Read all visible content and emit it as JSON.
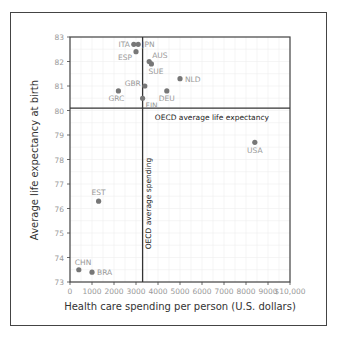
{
  "chart_data": {
    "type": "scatter",
    "title": "",
    "xlabel": "Health care spending per person (U.S. dollars)",
    "ylabel": "Average life expectancy at birth",
    "xlim": [
      0,
      10000
    ],
    "ylim": [
      73,
      83
    ],
    "x_ticks": [
      "0",
      "1000",
      "2000",
      "3000",
      "4000",
      "5000",
      "6000",
      "7000",
      "8000",
      "9000",
      "$10,000"
    ],
    "y_ticks": [
      "73",
      "74",
      "75",
      "76",
      "77",
      "78",
      "79",
      "80",
      "81",
      "82",
      "83"
    ],
    "grid": true,
    "reference_lines": [
      {
        "orientation": "horizontal",
        "value": 80.1,
        "label": "OECD average life expectancy"
      },
      {
        "orientation": "vertical",
        "value": 3300,
        "label": "OECD average spending"
      }
    ],
    "points": [
      {
        "label": "ITA",
        "x": 2900,
        "y": 82.7
      },
      {
        "label": "JPN",
        "x": 3100,
        "y": 82.7
      },
      {
        "label": "ESP",
        "x": 3000,
        "y": 82.4
      },
      {
        "label": "AUS",
        "x": 3600,
        "y": 82.0
      },
      {
        "label": "SUE",
        "x": 3700,
        "y": 81.9
      },
      {
        "label": "NLD",
        "x": 5000,
        "y": 81.3
      },
      {
        "label": "GBR",
        "x": 3400,
        "y": 81.0
      },
      {
        "label": "GRC",
        "x": 2200,
        "y": 80.8
      },
      {
        "label": "DEU",
        "x": 4400,
        "y": 80.8
      },
      {
        "label": "FIN",
        "x": 3300,
        "y": 80.5
      },
      {
        "label": "USA",
        "x": 8400,
        "y": 78.7
      },
      {
        "label": "EST",
        "x": 1300,
        "y": 76.3
      },
      {
        "label": "CHN",
        "x": 400,
        "y": 73.5
      },
      {
        "label": "BRA",
        "x": 1000,
        "y": 73.4
      }
    ]
  }
}
